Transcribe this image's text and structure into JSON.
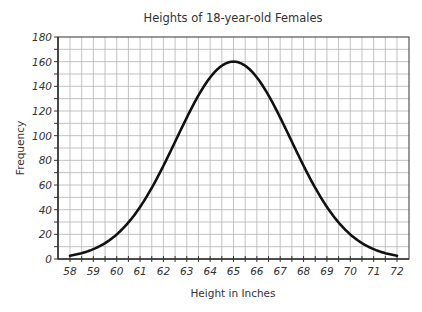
{
  "chart_data": {
    "type": "line",
    "title": "Heights of 18-year-old Females",
    "xlabel": "Height in Inches",
    "ylabel": "Frequency",
    "xlim": [
      58,
      72
    ],
    "ylim": [
      0,
      180
    ],
    "x_ticks": [
      58,
      59,
      60,
      61,
      62,
      63,
      64,
      65,
      66,
      67,
      68,
      69,
      70,
      71,
      72
    ],
    "y_ticks": [
      0,
      20,
      40,
      60,
      80,
      100,
      120,
      140,
      160,
      180
    ],
    "grid": true,
    "grid_minor_x": 0.5,
    "grid_minor_y": 10,
    "legend": null,
    "distribution": {
      "shape": "normal",
      "mean": 65,
      "std": 2.45,
      "peak": 160
    },
    "series": [
      {
        "name": "Heights of 18-year-old Females",
        "x": [
          58,
          59,
          60,
          61,
          62,
          63,
          64,
          65,
          66,
          67,
          68,
          69,
          70,
          71,
          72
        ],
        "values": [
          3,
          8,
          20,
          42,
          76,
          115,
          147,
          160,
          147,
          115,
          76,
          42,
          20,
          8,
          3
        ]
      }
    ]
  },
  "colors": {
    "curve": "#111111",
    "grid": "#b4b4b4",
    "axis": "#333333",
    "text": "#333333"
  }
}
